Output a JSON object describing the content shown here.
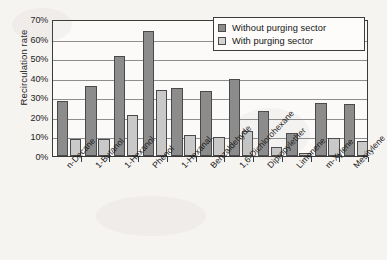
{
  "chart_data": {
    "type": "bar",
    "title": "",
    "xlabel": "",
    "ylabel": "Recirculation rate",
    "ylim": [
      0,
      70
    ],
    "ytick_labels": [
      "70%",
      "60%",
      "50%",
      "40%",
      "30%",
      "20%",
      "10%",
      "0%"
    ],
    "ytick_values": [
      70,
      60,
      50,
      40,
      30,
      20,
      10,
      0
    ],
    "grid": true,
    "legend_position": "top-right",
    "unit": "%",
    "categories": [
      "n-Decane",
      "1-Butanol",
      "1-Hexanol",
      "Phenol",
      "1-Hexanal",
      "Benzaldehyde",
      "1,6-Dichlorohexane",
      "Dipropylether",
      "Limonene",
      "m-Xylene",
      "Mesitylene"
    ],
    "series": [
      {
        "name": "Without purging sector",
        "color": "#8c8c8c",
        "values": [
          28,
          36,
          51,
          64,
          35,
          33,
          39.5,
          23,
          12,
          27,
          26.5
        ]
      },
      {
        "name": "With purging sector",
        "color": "#c9c9c9",
        "values": [
          8.5,
          8.5,
          21,
          33.5,
          10.5,
          9.5,
          13,
          4.7,
          1.3,
          9,
          7.5
        ]
      }
    ]
  },
  "legend": {
    "items": [
      {
        "label": "Without purging sector",
        "swatch": "dark"
      },
      {
        "label": "With purging sector",
        "swatch": "light"
      }
    ]
  }
}
